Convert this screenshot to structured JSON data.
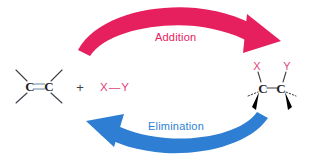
{
  "figure": {
    "type": "reaction-scheme",
    "background": "#ffffff",
    "colors": {
      "addition_arrow": "#e6205e",
      "elimination_arrow": "#2e7fd4",
      "reagent_text": "#e0457a",
      "substituent_text": "#e0457a",
      "structure_line": "#3a3f46",
      "double_bond": "#9fb6c9",
      "plus_sign": "#3a3f46"
    }
  },
  "reactants": {
    "alkene": {
      "left_carbon_label": "C",
      "right_carbon_label": "C",
      "bond_type": "double",
      "substituent_count": 4
    },
    "plus_sign": "+",
    "reagent": {
      "left_atom": "X",
      "bond": "—",
      "right_atom": "Y",
      "full": "X—Y"
    }
  },
  "product": {
    "left_carbon_label": "C",
    "right_carbon_label": "C",
    "bond_type": "single",
    "substituents": {
      "left_top": "X",
      "right_top": "Y"
    },
    "stereo_bonds": {
      "wedge_count": 2,
      "hash_count": 2
    }
  },
  "arrows": {
    "top": {
      "label": "Addition",
      "direction": "left-to-right",
      "color": "#e6205e"
    },
    "bottom": {
      "label": "Elimination",
      "direction": "right-to-left",
      "color": "#2e7fd4"
    }
  }
}
